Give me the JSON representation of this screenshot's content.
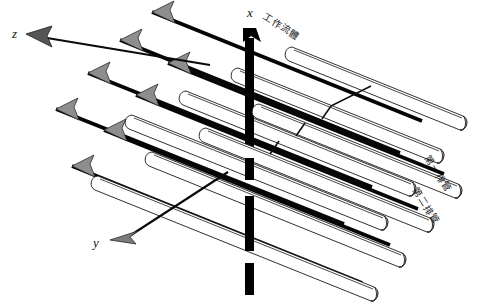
{
  "figure": {
    "title": ""
  },
  "axes": {
    "x": {
      "label": "x",
      "x": 247,
      "y": 17,
      "direction": "up",
      "style": "thick-black-bar"
    },
    "y": {
      "label": "y",
      "x": 93,
      "y": 247,
      "direction": "down-left",
      "style": "thin-black-gray-head"
    },
    "z": {
      "label": "z",
      "x": 12,
      "y": 38,
      "direction": "up-left",
      "style": "thin-black-gray-head"
    }
  },
  "annotations": {
    "working_fluid": {
      "text": "工作流體",
      "x": 262,
      "y": 18,
      "rotation": 32
    },
    "first_row": {
      "text": "第一排管",
      "x": 424,
      "y": 158,
      "rotation": 58
    },
    "second_row": {
      "text": "第二排管",
      "x": 412,
      "y": 190,
      "rotation": 58
    }
  },
  "tubes": {
    "count": 8,
    "rows": 2,
    "per_row": 4,
    "orientation": "diagonal-up-right",
    "fill_color": "#ffffff",
    "stroke_color": "#1a1a1a"
  },
  "flow_arrows": {
    "count": 8,
    "shaft_color": "#050505",
    "head_color": "#8e8e8e",
    "direction": "up-left"
  },
  "leaders": {
    "count": 3,
    "color": "#101010"
  }
}
